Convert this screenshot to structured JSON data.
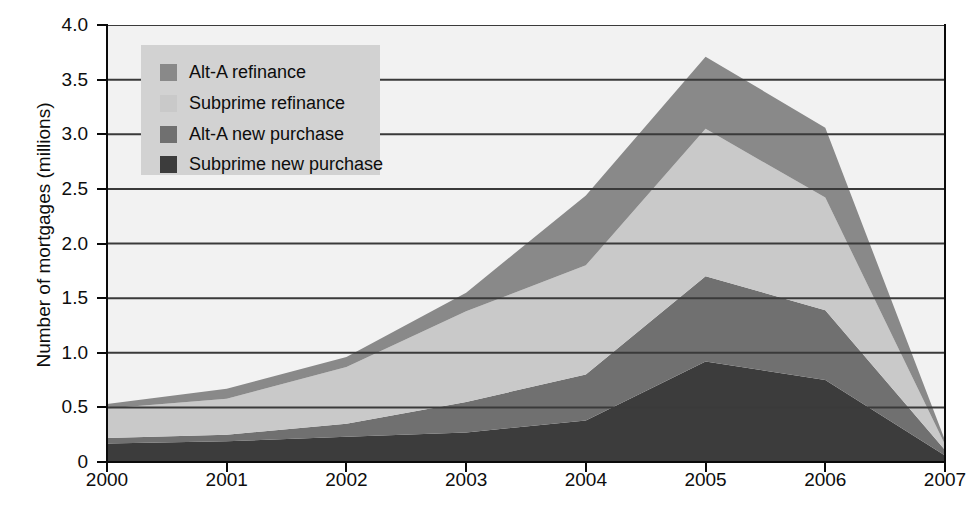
{
  "chart_data": {
    "type": "area",
    "stacked": true,
    "title": "",
    "xlabel": "",
    "ylabel": "Number of mortgages (millions)",
    "x": [
      "2000",
      "2001",
      "2002",
      "2003",
      "2004",
      "2005",
      "2006",
      "2007"
    ],
    "xlim": [
      2000,
      2007
    ],
    "ylim": [
      0,
      4.0
    ],
    "yticks": [
      "0",
      "0.5",
      "1.0",
      "1.5",
      "2.0",
      "2.5",
      "3.0",
      "3.5",
      "4.0"
    ],
    "ytick_values": [
      0,
      0.5,
      1.0,
      1.5,
      2.0,
      2.5,
      3.0,
      3.5,
      4.0
    ],
    "grid": true,
    "legend_position": "upper-left",
    "series": [
      {
        "name": "Subprime new purchase",
        "color": "#3c3c3c",
        "values": [
          0.17,
          0.19,
          0.23,
          0.27,
          0.38,
          0.92,
          0.75,
          0.06
        ]
      },
      {
        "name": "Alt-A new purchase",
        "color": "#707070",
        "values": [
          0.05,
          0.06,
          0.12,
          0.28,
          0.42,
          0.78,
          0.64,
          0.05
        ]
      },
      {
        "name": "Subprime refinance",
        "color": "#c9c9c9",
        "values": [
          0.27,
          0.33,
          0.52,
          0.83,
          1.0,
          1.35,
          1.03,
          0.05
        ]
      },
      {
        "name": "Alt-A refinance",
        "color": "#898989",
        "values": [
          0.04,
          0.09,
          0.09,
          0.17,
          0.64,
          0.66,
          0.64,
          0.04
        ]
      }
    ],
    "stack_totals": [
      0.53,
      0.67,
      0.96,
      1.55,
      2.44,
      3.71,
      3.06,
      0.2
    ]
  },
  "legend": {
    "items": [
      {
        "label": "Alt-A refinance",
        "color": "#898989"
      },
      {
        "label": "Subprime refinance",
        "color": "#c9c9c9"
      },
      {
        "label": "Alt-A new purchase",
        "color": "#707070"
      },
      {
        "label": "Subprime new purchase",
        "color": "#3c3c3c"
      }
    ]
  },
  "colors": {
    "plot_background": "#f2f2f2",
    "legend_background": "#d2d2d2",
    "axis": "#0a0a0a",
    "gridline": "#3a3a3a",
    "text": "#0d0d0d"
  }
}
